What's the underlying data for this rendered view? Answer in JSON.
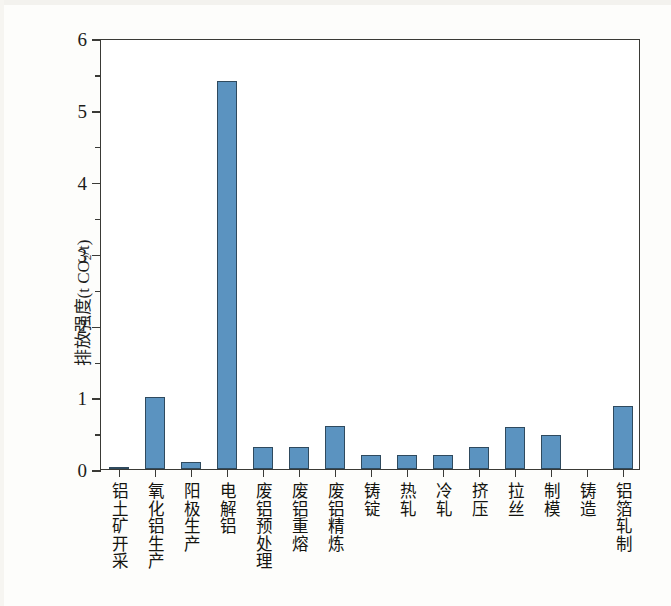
{
  "chart_data": {
    "type": "bar",
    "title": "",
    "xlabel": "",
    "ylabel": "排放强度(t CO2/t)",
    "ylabel_parts": {
      "prefix": "排放强度(t CO",
      "sub": "2",
      "suffix": "/t)"
    },
    "ylim": [
      0,
      6
    ],
    "yticks": [
      0,
      1,
      2,
      3,
      4,
      5,
      6
    ],
    "ytick_labels": [
      "0",
      "1",
      "2",
      "3",
      "4",
      "5",
      "6"
    ],
    "yminor_step": 0.5,
    "grid": false,
    "legend": "none",
    "bar_color": "#5b93c0",
    "bar_edge_color": "#2f4a5e",
    "categories": [
      "铝土矿开采",
      "氧化铝生产",
      "阳极生产",
      "电解铝",
      "废铝预处理",
      "废铝重熔",
      "废铝精炼",
      "铸锭",
      "热轧",
      "冷轧",
      "挤压",
      "拉丝",
      "制模",
      "铸造",
      "铝箔轧制"
    ],
    "values": [
      0.02,
      1.0,
      0.1,
      5.4,
      0.3,
      0.3,
      0.6,
      0.2,
      0.2,
      0.2,
      0.3,
      0.58,
      0.48,
      0.0,
      0.88
    ]
  }
}
